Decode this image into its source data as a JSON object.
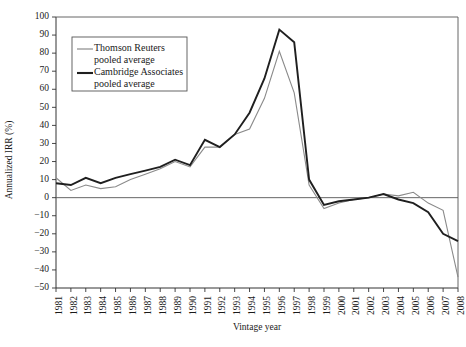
{
  "chart_data": {
    "type": "line",
    "title": "",
    "subtitle": "",
    "xlabel": "Vintage year",
    "ylabel": "Annualized IRR (%)",
    "xlim": [
      1981,
      2008
    ],
    "ylim": [
      -50,
      100
    ],
    "ytick_step": 10,
    "grid": false,
    "zero_line": true,
    "legend_position": "top-left-inside",
    "x": [
      1981,
      1982,
      1983,
      1984,
      1985,
      1986,
      1987,
      1988,
      1989,
      1990,
      1991,
      1992,
      1993,
      1994,
      1995,
      1996,
      1997,
      1998,
      1999,
      2000,
      2001,
      2002,
      2003,
      2004,
      2005,
      2006,
      2007,
      2008
    ],
    "xtick_labels": [
      "1981",
      "1982",
      "1983",
      "1984",
      "1985",
      "1986",
      "1987",
      "1988",
      "1989",
      "1990",
      "1991",
      "1992",
      "1993",
      "1994",
      "1995",
      "1996",
      "1997",
      "1998",
      "1999",
      "2000",
      "2001",
      "2002",
      "2003",
      "2004",
      "2005",
      "2006",
      "2007",
      "2008"
    ],
    "ytick_labels": [
      "100",
      "90",
      "80",
      "70",
      "60",
      "50",
      "40",
      "30",
      "20",
      "10",
      "0",
      "−10",
      "−20",
      "−30",
      "−40",
      "−50"
    ],
    "ytick_values": [
      100,
      90,
      80,
      70,
      60,
      50,
      40,
      30,
      20,
      10,
      0,
      -10,
      -20,
      -30,
      -40,
      -50
    ],
    "series": [
      {
        "name": "Thomson Reuters pooled average",
        "color": "#8a8a8a",
        "line_width": 1.1,
        "values": [
          11,
          4,
          7,
          5,
          6,
          10,
          13,
          16,
          20,
          17,
          28,
          28,
          35,
          38,
          55,
          81,
          58,
          7,
          -6,
          -3,
          -1,
          0,
          2,
          1,
          3,
          -3,
          -7,
          -44
        ]
      },
      {
        "name": "Cambridge Associates pooled average",
        "color": "#1f1f1f",
        "line_width": 1.9,
        "values": [
          8,
          7,
          11,
          8,
          11,
          13,
          15,
          17,
          21,
          18,
          32,
          28,
          35,
          47,
          66,
          93,
          86,
          10,
          -4,
          -2,
          -1,
          0,
          2,
          -1,
          -3,
          -8,
          -20,
          -24
        ]
      }
    ],
    "legend": [
      {
        "label_line1": "Thomson Reuters",
        "label_line2": "pooled average",
        "series": "Thomson Reuters pooled average"
      },
      {
        "label_line1": "Cambridge Associates",
        "label_line2": "pooled average",
        "series": "Cambridge Associates pooled average"
      }
    ],
    "colors": {
      "thomson": "#8a8a8a",
      "cambridge": "#1f1f1f",
      "axis": "#333333",
      "zero_line": "#555555",
      "background": "#ffffff"
    }
  }
}
